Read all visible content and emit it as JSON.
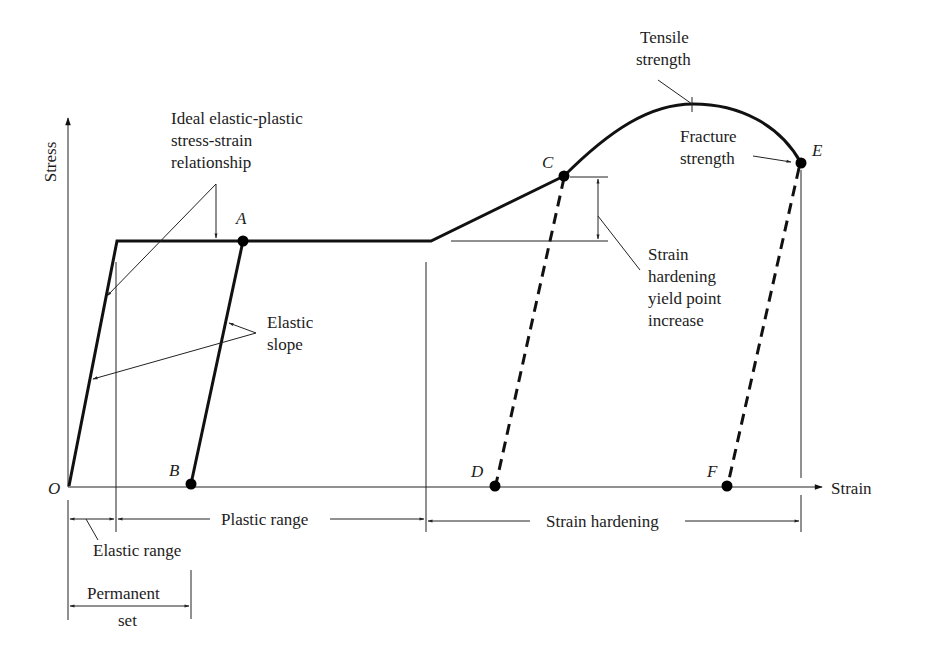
{
  "diagram": {
    "axes": {
      "y_label": "Stress",
      "x_label": "Strain",
      "origin_label": "O"
    },
    "points": {
      "A": "A",
      "B": "B",
      "C": "C",
      "D": "D",
      "E": "E",
      "F": "F"
    },
    "annotations": {
      "ideal": [
        "Ideal elastic-plastic",
        "stress-strain",
        "relationship"
      ],
      "elastic_slope": [
        "Elastic",
        "slope"
      ],
      "tensile": [
        "Tensile",
        "strength"
      ],
      "fracture": [
        "Fracture",
        "strength"
      ],
      "sh_yield": [
        "Strain",
        "hardening",
        "yield point",
        "increase"
      ]
    },
    "ranges": {
      "elastic_range": "Elastic range",
      "plastic_range": "Plastic range",
      "strain_hardening": "Strain hardening",
      "permanent_set": [
        "Permanent",
        "set"
      ]
    }
  }
}
